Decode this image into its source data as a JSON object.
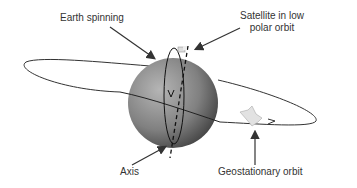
{
  "diagram": {
    "labels": {
      "earth_spinning": "Earth spinning",
      "satellite_polar_line1": "Satellite in low",
      "satellite_polar_line2": "polar orbit",
      "axis": "Axis",
      "geostationary": "Geostationary orbit"
    },
    "colors": {
      "earth_dark": "#555555",
      "earth_light": "#a8a8a8",
      "orbit": "#333333",
      "text": "#333333"
    }
  }
}
